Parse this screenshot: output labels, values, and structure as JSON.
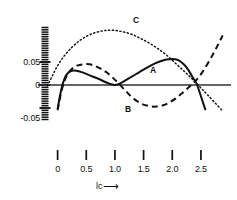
{
  "chart_data": {
    "type": "line",
    "title": "",
    "subtitle": "",
    "xlabel": "lc",
    "xlabel_arrow": "⟶",
    "ylabel": "",
    "xlim": [
      -0.22,
      2.92
    ],
    "ylim": [
      -0.088,
      0.138
    ],
    "grid": false,
    "legend_position": "inline-annotations",
    "zero_line": 0,
    "xticks": [
      0,
      0.5,
      1.0,
      1.5,
      2.0,
      2.5
    ],
    "xticklabels": [
      "0",
      "0.5",
      "1.0",
      "1.5",
      "2.0",
      "2.5"
    ],
    "yticks": [
      -0.05,
      0,
      0.05
    ],
    "yticklabels": [
      "-0.05",
      "0",
      "0.05"
    ],
    "yminor_step": 0.005,
    "yminor_range": [
      -0.075,
      0.125
    ],
    "annotations": [
      {
        "text": "A",
        "x": 1.62,
        "y": 0.028
      },
      {
        "text": "B",
        "x": 1.36,
        "y": -0.028
      },
      {
        "text": "C",
        "x": 1.45,
        "y": 0.118
      }
    ],
    "series": [
      {
        "name": "A",
        "label": "A",
        "style": "solid",
        "color": "#111111",
        "x": [
          0.0,
          0.06,
          0.12,
          0.18,
          0.25,
          0.33,
          0.42,
          0.52,
          0.62,
          0.72,
          0.82,
          0.9,
          0.96,
          1.0,
          1.06,
          1.14,
          1.25,
          1.4,
          1.55,
          1.7,
          1.85,
          1.97,
          2.05,
          2.12,
          2.2,
          2.28,
          2.35,
          2.42,
          2.47,
          2.52,
          2.58
        ],
        "y": [
          -0.052,
          -0.012,
          0.014,
          0.026,
          0.031,
          0.031,
          0.028,
          0.023,
          0.018,
          0.013,
          0.007,
          0.003,
          0.001,
          0.0,
          0.002,
          0.007,
          0.015,
          0.026,
          0.037,
          0.047,
          0.054,
          0.056,
          0.056,
          0.053,
          0.045,
          0.033,
          0.018,
          0.004,
          -0.013,
          -0.032,
          -0.055
        ]
      },
      {
        "name": "B",
        "label": "B",
        "style": "dashed",
        "color": "#111111",
        "x": [
          0.0,
          0.07,
          0.15,
          0.24,
          0.34,
          0.45,
          0.56,
          0.66,
          0.76,
          0.86,
          0.96,
          1.06,
          1.18,
          1.3,
          1.45,
          1.6,
          1.72,
          1.84,
          1.95,
          2.06,
          2.16,
          2.26,
          2.35,
          2.43,
          2.52,
          2.62,
          2.72,
          2.8,
          2.88
        ],
        "y": [
          -0.055,
          -0.012,
          0.018,
          0.034,
          0.042,
          0.045,
          0.045,
          0.041,
          0.035,
          0.027,
          0.016,
          0.004,
          -0.012,
          -0.027,
          -0.04,
          -0.046,
          -0.047,
          -0.044,
          -0.038,
          -0.029,
          -0.019,
          -0.008,
          0.002,
          0.012,
          0.027,
          0.047,
          0.069,
          0.088,
          0.108
        ]
      },
      {
        "name": "C",
        "label": "C",
        "style": "dotted",
        "color": "#111111",
        "x": [
          -0.18,
          -0.1,
          0.0,
          0.12,
          0.25,
          0.38,
          0.52,
          0.66,
          0.8,
          0.92,
          1.04,
          1.16,
          1.3,
          1.45,
          1.6,
          1.75,
          1.9,
          2.05,
          2.18,
          2.3,
          2.42,
          2.52,
          2.62,
          2.74,
          2.86
        ],
        "y": [
          -0.002,
          0.018,
          0.042,
          0.064,
          0.082,
          0.096,
          0.107,
          0.114,
          0.118,
          0.119,
          0.118,
          0.115,
          0.11,
          0.101,
          0.091,
          0.079,
          0.065,
          0.048,
          0.033,
          0.019,
          0.004,
          -0.009,
          -0.022,
          -0.038,
          -0.054
        ]
      }
    ]
  },
  "axis_caption": {
    "name": "lc",
    "arrow": "⟶"
  }
}
